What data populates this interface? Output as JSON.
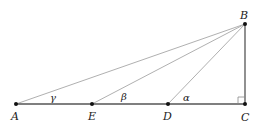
{
  "diagram": {
    "type": "geometry-right-triangle",
    "points": {
      "A": {
        "label": "A",
        "x": 16,
        "y": 104
      },
      "E": {
        "label": "E",
        "x": 92,
        "y": 104
      },
      "D": {
        "label": "D",
        "x": 168,
        "y": 104
      },
      "C": {
        "label": "C",
        "x": 245,
        "y": 104
      },
      "B": {
        "label": "B",
        "x": 245,
        "y": 24
      }
    },
    "angles": {
      "gamma": {
        "label": "γ",
        "at": "A"
      },
      "beta": {
        "label": "β",
        "at": "E"
      },
      "alpha": {
        "label": "α",
        "at": "D"
      }
    },
    "segments": [
      [
        "A",
        "C"
      ],
      [
        "C",
        "B"
      ],
      [
        "A",
        "B"
      ],
      [
        "E",
        "B"
      ],
      [
        "D",
        "B"
      ]
    ],
    "right_angle_at": "C",
    "colors": {
      "base_line": "#555555",
      "slant_lines": "#b0b0b0",
      "points": "#111111"
    }
  }
}
